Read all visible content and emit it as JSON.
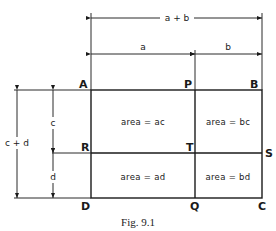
{
  "figure": {
    "caption": "Fig. 9.1",
    "points": {
      "A": "A",
      "P": "P",
      "B": "B",
      "R": "R",
      "T": "T",
      "S": "S",
      "D": "D",
      "Q": "Q",
      "C": "C"
    },
    "dimensions": {
      "total_width": "a + b",
      "width_a": "a",
      "width_b": "b",
      "total_height": "c + d",
      "height_c": "c",
      "height_d": "d"
    },
    "regions": {
      "top_left": "area = ac",
      "top_right": "area = bc",
      "bottom_left": "area = ad",
      "bottom_right": "area = bd"
    },
    "colors": {
      "line": "#1a1a1a",
      "background": "#ffffff"
    }
  }
}
